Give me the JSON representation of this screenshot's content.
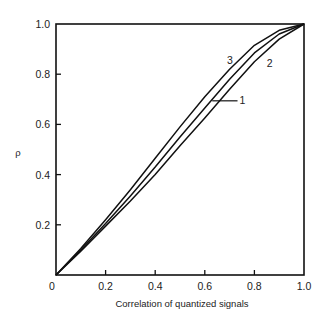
{
  "chart_data": {
    "type": "line",
    "title": "",
    "xlabel": "Correlation of quantized signals",
    "ylabel": "ρ",
    "xlim": [
      0,
      1.0
    ],
    "ylim": [
      0,
      1.0
    ],
    "grid": false,
    "legend": "inline curve labels",
    "x_ticks": [
      "0",
      "0.2",
      "0.4",
      "0.6",
      "0.8",
      "1.0"
    ],
    "y_ticks": [
      "0.2",
      "0.4",
      "0.6",
      "0.8",
      "1.0"
    ],
    "x": [
      0,
      0.1,
      0.2,
      0.3,
      0.4,
      0.5,
      0.6,
      0.7,
      0.8,
      0.9,
      1.0
    ],
    "series": [
      {
        "name": "1",
        "values": [
          0,
          0.1,
          0.205,
          0.315,
          0.43,
          0.55,
          0.665,
          0.78,
          0.885,
          0.96,
          1.0
        ]
      },
      {
        "name": "2",
        "values": [
          0,
          0.095,
          0.195,
          0.295,
          0.4,
          0.515,
          0.625,
          0.74,
          0.85,
          0.94,
          1.0
        ]
      },
      {
        "name": "3",
        "values": [
          0,
          0.105,
          0.22,
          0.34,
          0.465,
          0.59,
          0.71,
          0.82,
          0.915,
          0.975,
          1.0
        ]
      }
    ],
    "annotations": [
      {
        "text": "3",
        "x": 0.69,
        "y": 0.84
      },
      {
        "text": "2",
        "x": 0.85,
        "y": 0.83
      },
      {
        "text": "1",
        "x": 0.74,
        "y": 0.68,
        "leader_from_x": 0.63
      }
    ]
  }
}
